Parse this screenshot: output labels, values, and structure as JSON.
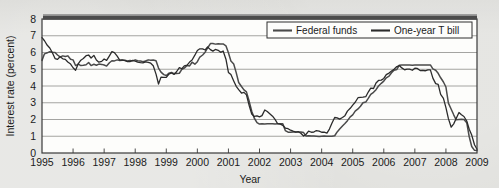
{
  "figure": {
    "background_color": "#dcdcd8",
    "plot_background_color": "#fdfdfb",
    "frame_color": "#3a3a3a",
    "gridline_color": "#9a9a96",
    "top_band_color": "#4c4c4c"
  },
  "axes": {
    "ylabel": "Interest rate (percent)",
    "xlabel": "Year",
    "yticks": [
      "0",
      "1",
      "2",
      "3",
      "4",
      "5",
      "6",
      "7",
      "8"
    ],
    "xticks": [
      "1995",
      "1996",
      "1997",
      "1998",
      "1999",
      "2000",
      "2001",
      "2002",
      "2003",
      "2004",
      "2005",
      "2006",
      "2007",
      "2008",
      "2009"
    ]
  },
  "legend": {
    "position": "top-right",
    "entries": [
      {
        "label": "Federal funds",
        "color": "#4a4a4a"
      },
      {
        "label": "One-year T bill",
        "color": "#2b2b2b"
      }
    ]
  },
  "chart_data": {
    "type": "line",
    "title": "",
    "xlabel": "Year",
    "ylabel": "Interest rate (percent)",
    "xlim": [
      1995,
      2009
    ],
    "ylim": [
      0,
      8
    ],
    "grid": true,
    "legend_position": "top-right",
    "x": [
      1995.0,
      1995.08,
      1995.17,
      1995.25,
      1995.33,
      1995.42,
      1995.5,
      1995.58,
      1995.67,
      1995.75,
      1995.83,
      1995.92,
      1996.0,
      1996.08,
      1996.17,
      1996.25,
      1996.33,
      1996.42,
      1996.5,
      1996.58,
      1996.67,
      1996.75,
      1996.83,
      1996.92,
      1997.0,
      1997.08,
      1997.17,
      1997.25,
      1997.33,
      1997.42,
      1997.5,
      1997.58,
      1997.67,
      1997.75,
      1997.83,
      1997.92,
      1998.0,
      1998.08,
      1998.17,
      1998.25,
      1998.33,
      1998.42,
      1998.5,
      1998.58,
      1998.67,
      1998.75,
      1998.83,
      1998.92,
      1999.0,
      1999.08,
      1999.17,
      1999.25,
      1999.33,
      1999.42,
      1999.5,
      1999.58,
      1999.67,
      1999.75,
      1999.83,
      1999.92,
      2000.0,
      2000.08,
      2000.17,
      2000.25,
      2000.33,
      2000.42,
      2000.5,
      2000.58,
      2000.67,
      2000.75,
      2000.83,
      2000.92,
      2001.0,
      2001.08,
      2001.17,
      2001.25,
      2001.33,
      2001.42,
      2001.5,
      2001.58,
      2001.67,
      2001.75,
      2001.83,
      2001.92,
      2002.0,
      2002.08,
      2002.17,
      2002.25,
      2002.33,
      2002.42,
      2002.5,
      2002.58,
      2002.67,
      2002.75,
      2002.83,
      2002.92,
      2003.0,
      2003.08,
      2003.17,
      2003.25,
      2003.33,
      2003.42,
      2003.5,
      2003.58,
      2003.67,
      2003.75,
      2003.83,
      2003.92,
      2004.0,
      2004.08,
      2004.17,
      2004.25,
      2004.33,
      2004.42,
      2004.5,
      2004.58,
      2004.67,
      2004.75,
      2004.83,
      2004.92,
      2005.0,
      2005.08,
      2005.17,
      2005.25,
      2005.33,
      2005.42,
      2005.5,
      2005.58,
      2005.67,
      2005.75,
      2005.83,
      2005.92,
      2006.0,
      2006.08,
      2006.17,
      2006.25,
      2006.33,
      2006.42,
      2006.5,
      2006.58,
      2006.67,
      2006.75,
      2006.83,
      2006.92,
      2007.0,
      2007.08,
      2007.17,
      2007.25,
      2007.33,
      2007.42,
      2007.5,
      2007.58,
      2007.67,
      2007.75,
      2007.83,
      2007.92,
      2008.0,
      2008.08,
      2008.17,
      2008.25,
      2008.33,
      2008.42,
      2008.5,
      2008.58,
      2008.67,
      2008.75,
      2008.83,
      2008.92,
      2009.0
    ],
    "series": [
      {
        "name": "Federal funds",
        "color": "#4a4a4a",
        "values": [
          5.53,
          5.92,
          5.98,
          6.05,
          6.01,
          6.0,
          5.85,
          5.74,
          5.8,
          5.76,
          5.8,
          5.6,
          5.56,
          5.22,
          5.31,
          5.22,
          5.24,
          5.27,
          5.4,
          5.22,
          5.3,
          5.24,
          5.31,
          5.29,
          5.25,
          5.19,
          5.39,
          5.51,
          5.5,
          5.56,
          5.52,
          5.54,
          5.54,
          5.5,
          5.52,
          5.5,
          5.56,
          5.51,
          5.49,
          5.45,
          5.49,
          5.56,
          5.54,
          5.55,
          5.51,
          5.07,
          4.83,
          4.68,
          4.63,
          4.76,
          4.81,
          4.74,
          4.74,
          4.76,
          4.99,
          5.07,
          5.22,
          5.2,
          5.42,
          5.3,
          5.45,
          5.73,
          5.85,
          6.02,
          6.27,
          6.53,
          6.54,
          6.5,
          6.52,
          6.51,
          6.51,
          6.4,
          5.98,
          5.49,
          5.31,
          4.8,
          4.21,
          3.97,
          3.77,
          3.65,
          3.07,
          2.49,
          2.09,
          1.82,
          1.73,
          1.74,
          1.73,
          1.75,
          1.75,
          1.75,
          1.73,
          1.74,
          1.75,
          1.75,
          1.34,
          1.24,
          1.24,
          1.26,
          1.25,
          1.26,
          1.26,
          1.22,
          1.01,
          1.03,
          1.01,
          1.01,
          1.0,
          0.98,
          1.0,
          1.01,
          1.0,
          1.0,
          1.0,
          1.03,
          1.26,
          1.43,
          1.61,
          1.76,
          1.93,
          2.16,
          2.28,
          2.5,
          2.63,
          2.79,
          3.0,
          3.04,
          3.26,
          3.5,
          3.62,
          3.78,
          4.0,
          4.16,
          4.29,
          4.49,
          4.59,
          4.79,
          4.94,
          4.99,
          5.24,
          5.25,
          5.25,
          5.25,
          5.25,
          5.24,
          5.25,
          5.26,
          5.26,
          5.25,
          5.25,
          5.25,
          5.26,
          5.02,
          4.94,
          4.76,
          4.49,
          4.24,
          3.94,
          2.98,
          2.61,
          2.28,
          1.98,
          2.0,
          2.01,
          2.0,
          1.81,
          0.97,
          0.39,
          0.16,
          0.15
        ]
      },
      {
        "name": "One-year T bill",
        "color": "#2b2b2b",
        "values": [
          6.89,
          6.7,
          6.43,
          6.27,
          6.0,
          5.64,
          5.59,
          5.75,
          5.62,
          5.59,
          5.43,
          5.31,
          5.09,
          4.94,
          5.34,
          5.54,
          5.64,
          5.81,
          5.85,
          5.67,
          5.83,
          5.55,
          5.42,
          5.47,
          5.61,
          5.53,
          5.8,
          6.05,
          5.99,
          5.78,
          5.54,
          5.56,
          5.52,
          5.46,
          5.46,
          5.53,
          5.48,
          5.42,
          5.39,
          5.38,
          5.44,
          5.41,
          5.36,
          5.21,
          4.71,
          4.12,
          4.53,
          4.52,
          4.51,
          4.7,
          4.78,
          4.69,
          4.85,
          5.1,
          5.03,
          5.2,
          5.25,
          5.43,
          5.55,
          5.84,
          6.12,
          6.22,
          6.22,
          6.15,
          6.33,
          6.17,
          6.08,
          6.18,
          6.13,
          6.01,
          6.09,
          5.6,
          4.81,
          4.68,
          4.3,
          3.98,
          3.78,
          3.58,
          3.62,
          3.47,
          2.82,
          2.33,
          2.18,
          2.22,
          2.16,
          2.23,
          2.57,
          2.48,
          2.35,
          2.2,
          2.01,
          1.76,
          1.72,
          1.65,
          1.49,
          1.45,
          1.36,
          1.3,
          1.24,
          1.27,
          1.18,
          1.01,
          1.12,
          1.31,
          1.24,
          1.25,
          1.34,
          1.31,
          1.24,
          1.24,
          1.19,
          1.43,
          1.78,
          2.12,
          2.1,
          2.02,
          2.12,
          2.23,
          2.5,
          2.67,
          2.86,
          3.03,
          3.3,
          3.32,
          3.33,
          3.36,
          3.64,
          3.87,
          3.85,
          4.18,
          4.33,
          4.35,
          4.45,
          4.68,
          4.77,
          4.9,
          5.0,
          5.16,
          5.22,
          5.08,
          4.97,
          5.01,
          5.01,
          4.94,
          5.06,
          5.05,
          4.92,
          4.93,
          4.91,
          4.96,
          4.96,
          4.47,
          4.14,
          4.1,
          3.5,
          3.26,
          2.71,
          2.05,
          1.54,
          1.74,
          2.06,
          2.42,
          2.28,
          2.18,
          1.91,
          1.42,
          1.07,
          0.49,
          0.22
        ]
      }
    ]
  }
}
